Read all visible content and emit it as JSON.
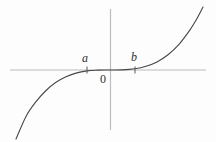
{
  "figure": {
    "kind": "math-function-plot",
    "background_color": "#fdfdfd",
    "axis_color": "#bcbcbc",
    "curve_color": "#474747",
    "tick_color": "#5a5a5a",
    "label_color": "#2e2e2e"
  },
  "chart_data": {
    "type": "line",
    "title": "",
    "xlabel": "",
    "ylabel": "",
    "axes": {
      "x_axis_px": {
        "x1": 10,
        "x2": 206,
        "y": 70
      },
      "y_axis_px": {
        "x": 110.5,
        "y1": 9,
        "y2": 130
      },
      "grid": false
    },
    "ticks": [
      {
        "label": "a",
        "x_px": 87,
        "label_x": 85,
        "label_y": 62,
        "side": "negative-x"
      },
      {
        "label": "b",
        "x_px": 135,
        "label_x": 134,
        "label_y": 61,
        "side": "positive-x"
      }
    ],
    "tick_half_height_px": 3.5,
    "origin_label": {
      "text": "0",
      "x_px": 103,
      "y_px": 83
    },
    "curve_points_px": [
      [
        16,
        139
      ],
      [
        26,
        116.4
      ],
      [
        36,
        101.7
      ],
      [
        46,
        90.5
      ],
      [
        56,
        82.3
      ],
      [
        66,
        76.7
      ],
      [
        76,
        73.1
      ],
      [
        87,
        70.9
      ],
      [
        98,
        70.1
      ],
      [
        110,
        70
      ],
      [
        122,
        69.9
      ],
      [
        135,
        68.8
      ],
      [
        146,
        66.3
      ],
      [
        157,
        61.9
      ],
      [
        168,
        54.7
      ],
      [
        179,
        44.3
      ],
      [
        190,
        29.9
      ],
      [
        196,
        20.2
      ],
      [
        203,
        7
      ]
    ]
  }
}
